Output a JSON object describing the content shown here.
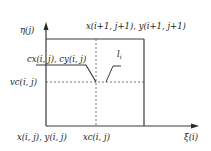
{
  "diagram": {
    "axes": {
      "y_label": "η(j)",
      "x_label": "ξ(i)"
    },
    "labels": {
      "top_right_corner": "x(i+1, j+1), y(i+1, j+1)",
      "bottom_left_corner": "x(i, j), y(i, j)",
      "center_point": "cx(i, j), cy(i, j)",
      "vc": "vc(i, j)",
      "xc": "xc(i, j)",
      "interface_line": "l",
      "interface_line_subscript": "i"
    },
    "colors": {
      "line": "#3a3a3a",
      "dashed": "#555555",
      "text": "#1a1a1a",
      "background": "#ffffff"
    }
  }
}
